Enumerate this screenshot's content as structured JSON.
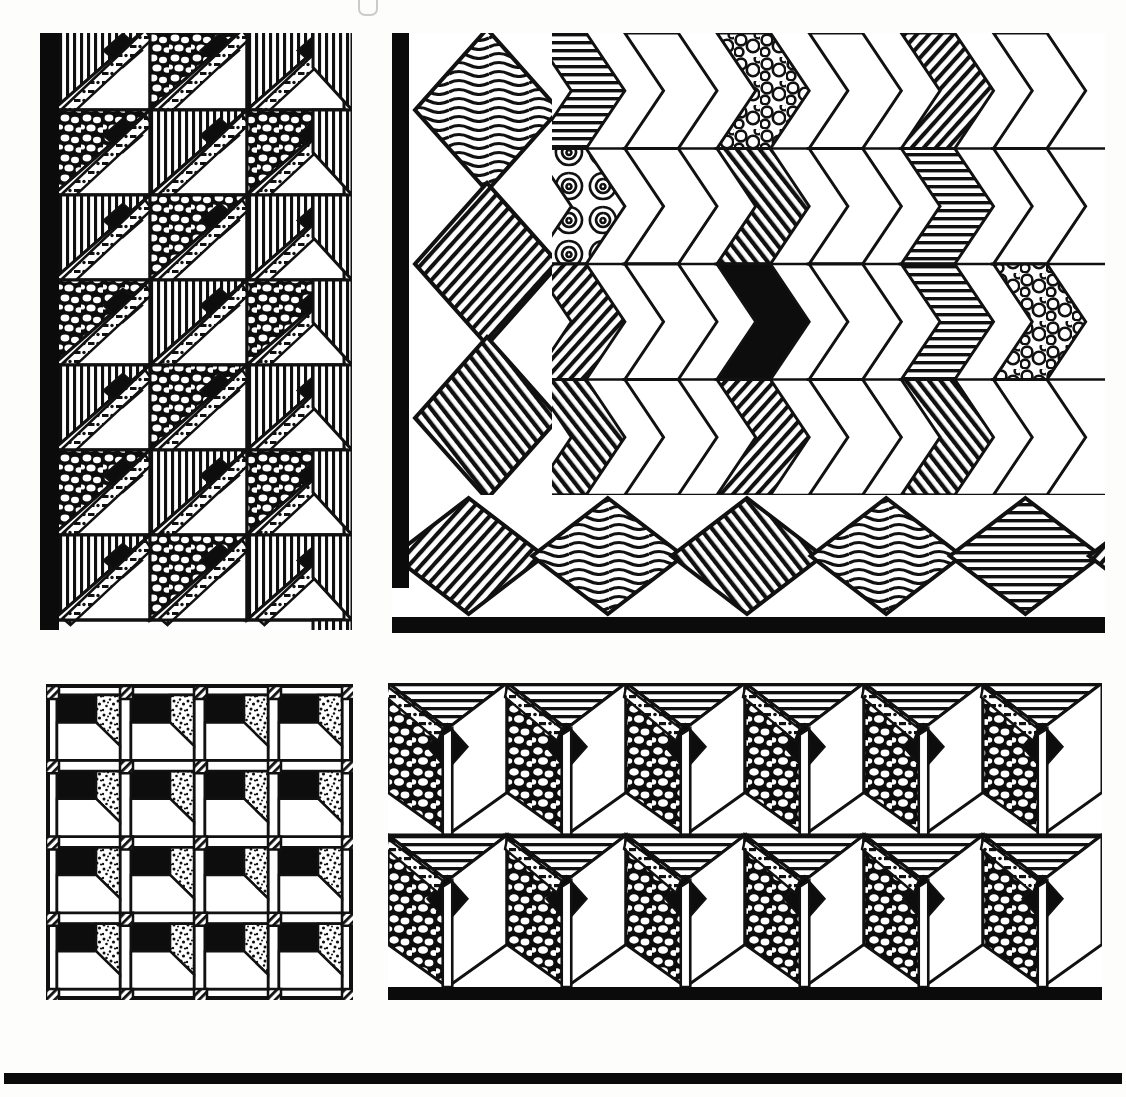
{
  "plate": {
    "title": "Quilt Pattern Plate",
    "description": "Pen-and-ink plate of four geometric quilt / tile pattern drawings",
    "background_color": "#ffffff",
    "ink_color": "#0b0b0b",
    "scan_mark": "partial-glyph-top-edge"
  },
  "panels": [
    {
      "id": "panel-1",
      "name": "diagonal-stripe-quilt",
      "position": "top-left",
      "bounds": {
        "x": 40,
        "y": 33,
        "w": 312,
        "h": 597
      },
      "border": "solid black bar on left edge",
      "grid": {
        "columns": 3,
        "rows": 7
      },
      "textures": [
        "vertical-hatch",
        "pebble",
        "solid-black",
        "white",
        "dot-dash-strip"
      ],
      "motif": "half-square triangles forming zigzag bands with black diamonds"
    },
    {
      "id": "panel-2",
      "name": "chevron-quilt-with-diamond-border",
      "position": "top-right",
      "bounds": {
        "x": 392,
        "y": 33,
        "w": 713,
        "h": 600
      },
      "border": "solid black bar on left edge and bottom edge",
      "grid": {
        "chevron_columns": 6,
        "chevron_rows": 4,
        "border_diamonds": 5,
        "side_diamonds": 3
      },
      "textures": [
        "wavy-hatch",
        "diagonal-hatch",
        "horizontal-hatch",
        "bubble",
        "solid-black",
        "white"
      ],
      "motif": "interlocking chevrons with textured diamond border"
    },
    {
      "id": "panel-3",
      "name": "sashed-block-grid",
      "position": "bottom-left",
      "bounds": {
        "x": 46,
        "y": 684,
        "w": 307,
        "h": 316
      },
      "border": "thin black frame",
      "grid": {
        "columns": 4,
        "rows": 4
      },
      "textures": [
        "solid-black",
        "stipple-dots",
        "white",
        "diagonal-slash-corner"
      ],
      "motif": "blocks with black bar, stipple triangle and white step, separated by sashing with striped corner squares"
    },
    {
      "id": "panel-4",
      "name": "zigzag-column-quilt",
      "position": "bottom-right",
      "bounds": {
        "x": 388,
        "y": 683,
        "w": 714,
        "h": 317
      },
      "border": "solid black bar on bottom edge",
      "grid": {
        "columns": 6,
        "rows": 2
      },
      "textures": [
        "pebble",
        "horizontal-hatch",
        "solid-black",
        "white",
        "dot-dash-strip"
      ],
      "motif": "tall pebble-filled parallelogram columns framing black diamonds"
    }
  ],
  "bottom_rule": {
    "name": "page-bottom-rule",
    "color": "#0a0a0a",
    "bounds": {
      "x": 4,
      "y": 1073,
      "w": 1118,
      "h": 11
    }
  },
  "legend": {
    "texture_names": [
      "vertical-hatch",
      "horizontal-hatch",
      "diagonal-hatch",
      "wavy-hatch",
      "pebble",
      "bubble",
      "stipple-dots",
      "dot-dash-strip",
      "solid-black",
      "white"
    ]
  }
}
